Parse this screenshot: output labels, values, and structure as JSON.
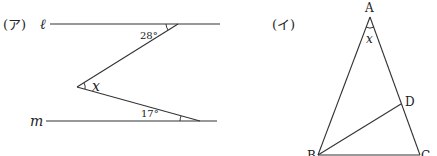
{
  "problem_a": {
    "label": "(ア)",
    "line_top_label": "ℓ",
    "line_bottom_label": "m",
    "angle_top": "28°",
    "angle_bottom": "17°",
    "unknown": "x"
  },
  "problem_b": {
    "label": "(イ)",
    "vertex_a": "A",
    "vertex_b": "B",
    "vertex_c": "C",
    "vertex_d": "D",
    "unknown": "x"
  }
}
